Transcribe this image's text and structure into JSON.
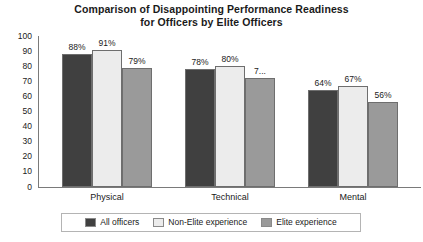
{
  "chart_data": {
    "type": "bar",
    "title": "Comparison of Disappointing Performance Readiness for Officers by Elite Officers",
    "title_lines": [
      "Comparison of Disappointing Performance Readiness",
      "for Officers by Elite Officers"
    ],
    "xlabel": "",
    "ylabel": "",
    "ylim": [
      0,
      100
    ],
    "ytick_step": 10,
    "yticks": [
      100,
      90,
      80,
      70,
      60,
      50,
      40,
      30,
      20,
      10,
      0
    ],
    "grid": false,
    "legend_position": "bottom",
    "categories": [
      "Physical",
      "Technical",
      "Mental"
    ],
    "series": [
      {
        "name": "All officers",
        "color": "#404040",
        "values": [
          88,
          78,
          64
        ],
        "labels": [
          "88%",
          "78%",
          "64%"
        ]
      },
      {
        "name": "Non-Elite experience",
        "color": "#ececec",
        "values": [
          91,
          80,
          67
        ],
        "labels": [
          "91%",
          "80%",
          "67%"
        ]
      },
      {
        "name": "Elite experience",
        "color": "#9a9a9a",
        "values": [
          79,
          72,
          56
        ],
        "labels": [
          "79%",
          "7...",
          "56%"
        ]
      }
    ]
  },
  "colors": {
    "all_officers": "#404040",
    "non_elite": "#ececec",
    "elite": "#9a9a9a",
    "axis": "#7a7a7a",
    "bar_outline": "#6e6e6e",
    "legend_border": "#b4b4b4",
    "background": "#ffffff",
    "text": "#1a1a1a"
  },
  "yticks": {
    "t100": "100",
    "t90": "90",
    "t80": "80",
    "t70": "70",
    "t60": "60",
    "t50": "50",
    "t40": "40",
    "t30": "30",
    "t20": "20",
    "t10": "10",
    "t0": "0"
  },
  "title": {
    "line1": "Comparison of Disappointing Performance Readiness",
    "line2": "for Officers by Elite Officers"
  },
  "categories": {
    "c0": "Physical",
    "c1": "Technical",
    "c2": "Mental"
  },
  "legend": {
    "items": [
      {
        "label": "All officers",
        "color": "#404040"
      },
      {
        "label": "Non-Elite experience",
        "color": "#ececec"
      },
      {
        "label": "Elite experience",
        "color": "#9a9a9a"
      }
    ]
  },
  "bar_labels": {
    "g0s0": "88%",
    "g0s1": "91%",
    "g0s2": "79%",
    "g1s0": "78%",
    "g1s1": "80%",
    "g1s2": "7...",
    "g2s0": "64%",
    "g2s1": "67%",
    "g2s2": "56%"
  }
}
